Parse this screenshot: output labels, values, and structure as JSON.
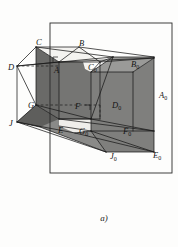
{
  "figure": {
    "caption": "a)",
    "frame": {
      "x": 50,
      "y": 23,
      "width": 122,
      "height": 150
    },
    "colors": {
      "background": "#fdfdfc",
      "stroke": "#1a1a1a",
      "frame_stroke": "#2a2a2a",
      "face_light": "#f2f1ee",
      "face_mid": "#8a8a88",
      "face_dark": "#6e6e6c",
      "face_darker": "#5f5f5d",
      "label_color": "#151515"
    },
    "labels": [
      {
        "id": "C",
        "base": "C",
        "sub": "",
        "x": 36,
        "y": 45
      },
      {
        "id": "B",
        "base": "B",
        "sub": "",
        "x": 79,
        "y": 46
      },
      {
        "id": "D",
        "base": "D",
        "sub": "",
        "x": 11,
        "y": 70
      },
      {
        "id": "A",
        "base": "A",
        "sub": "",
        "x": 54,
        "y": 73
      },
      {
        "id": "C0",
        "base": "C",
        "sub": "0",
        "x": 90,
        "y": 70
      },
      {
        "id": "B0",
        "base": "B",
        "sub": "0",
        "x": 133,
        "y": 67
      },
      {
        "id": "A0",
        "base": "A",
        "sub": "0",
        "x": 161,
        "y": 98
      },
      {
        "id": "G",
        "base": "G",
        "sub": "",
        "x": 30,
        "y": 108
      },
      {
        "id": "F",
        "base": "F",
        "sub": "",
        "x": 76,
        "y": 109
      },
      {
        "id": "D0",
        "base": "D",
        "sub": "0",
        "x": 114,
        "y": 108
      },
      {
        "id": "J",
        "base": "J",
        "sub": "",
        "x": 11,
        "y": 126
      },
      {
        "id": "E",
        "base": "E",
        "sub": "",
        "x": 59,
        "y": 133
      },
      {
        "id": "G0",
        "base": "G",
        "sub": "0",
        "x": 81,
        "y": 134
      },
      {
        "id": "F0",
        "base": "F",
        "sub": "0",
        "x": 125,
        "y": 134
      },
      {
        "id": "J0",
        "base": "J",
        "sub": "0",
        "x": 112,
        "y": 159
      },
      {
        "id": "E0",
        "base": "E",
        "sub": "0",
        "x": 155,
        "y": 158
      }
    ],
    "faces": [
      {
        "name": "left-prism-front-face",
        "shade": "#6e6e6c",
        "points": "36,47 36,105 59,119 59,62"
      },
      {
        "name": "left-prism-top-face",
        "shade": "#f2f1ee",
        "points": "36,47 59,62 100,62 79,47"
      },
      {
        "name": "right-solid-top-face",
        "shade": "#8a8a88",
        "points": "91,72 113,57 154,57 133,72"
      },
      {
        "name": "right-solid-front-face",
        "shade": "#7c7c7a",
        "points": "91,72 91,131 154,131 154,57"
      },
      {
        "name": "base-plane-strip",
        "shade": "#8a8a88",
        "points": "36,105 59,119 100,119 79,105"
      },
      {
        "name": "lower-right-wedge",
        "shade": "#6e6e6c",
        "points": "91,131 154,131 154,152 112,152"
      },
      {
        "name": "left-base-triangle",
        "shade": "#5f5f5d",
        "points": "16,122 36,105 59,119 40,126"
      }
    ],
    "edges": {
      "solid_count": 34,
      "hidden_dashed_count": 3
    }
  }
}
